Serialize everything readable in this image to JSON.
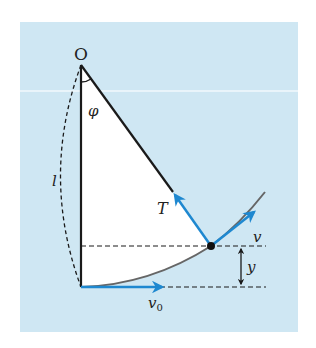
{
  "diagram": {
    "type": "pendulum",
    "labels": {
      "pivot": "O",
      "angle": "φ",
      "length": "l",
      "tension": "T",
      "velocity": "v",
      "initial_velocity": "v",
      "initial_velocity_sub": "0",
      "height": "y"
    },
    "colors": {
      "panel": "#cfe7f3",
      "sector": "#ffffff",
      "arrow": "#1e88d0",
      "line": "#1a1a1a",
      "arc": "#666666"
    }
  }
}
